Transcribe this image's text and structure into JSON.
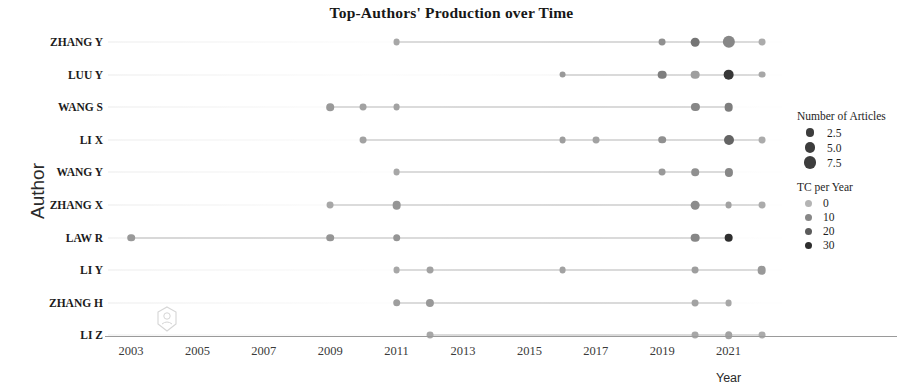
{
  "chart_data": {
    "type": "scatter",
    "title": "Top-Authors' Production over Time",
    "xlabel": "Year",
    "ylabel": "Author",
    "xlim": [
      2002,
      2022.6
    ],
    "xticks": [
      2003,
      2005,
      2007,
      2009,
      2011,
      2013,
      2015,
      2017,
      2019,
      2021
    ],
    "grid": false,
    "legend_position": "right",
    "categories": [
      "ZHANG Y",
      "LUU Y",
      "WANG S",
      "LI X",
      "WANG Y",
      "ZHANG X",
      "LAW R",
      "LI Y",
      "ZHANG H",
      "LI Z"
    ],
    "series": [
      {
        "name": "ZHANG Y",
        "span": [
          2011,
          2022
        ],
        "points": [
          {
            "year": 2011,
            "articles": 1,
            "tc_per_year": 3
          },
          {
            "year": 2019,
            "articles": 1,
            "tc_per_year": 8
          },
          {
            "year": 2020,
            "articles": 2.5,
            "tc_per_year": 14
          },
          {
            "year": 2021,
            "articles": 7.5,
            "tc_per_year": 10
          },
          {
            "year": 2022,
            "articles": 1,
            "tc_per_year": 2
          }
        ]
      },
      {
        "name": "LUU Y",
        "span": [
          2016,
          2022
        ],
        "points": [
          {
            "year": 2016,
            "articles": 1,
            "tc_per_year": 6
          },
          {
            "year": 2019,
            "articles": 2.5,
            "tc_per_year": 12
          },
          {
            "year": 2020,
            "articles": 2.5,
            "tc_per_year": 5
          },
          {
            "year": 2021,
            "articles": 5.0,
            "tc_per_year": 28
          },
          {
            "year": 2022,
            "articles": 1,
            "tc_per_year": 3
          }
        ]
      },
      {
        "name": "WANG S",
        "span": [
          2009,
          2021
        ],
        "points": [
          {
            "year": 2009,
            "articles": 1.5,
            "tc_per_year": 6
          },
          {
            "year": 2010,
            "articles": 1,
            "tc_per_year": 4
          },
          {
            "year": 2011,
            "articles": 1,
            "tc_per_year": 4
          },
          {
            "year": 2020,
            "articles": 2.0,
            "tc_per_year": 10
          },
          {
            "year": 2021,
            "articles": 2.5,
            "tc_per_year": 12
          }
        ]
      },
      {
        "name": "LI X",
        "span": [
          2010,
          2022
        ],
        "points": [
          {
            "year": 2010,
            "articles": 1,
            "tc_per_year": 4
          },
          {
            "year": 2016,
            "articles": 1,
            "tc_per_year": 5
          },
          {
            "year": 2017,
            "articles": 1,
            "tc_per_year": 4
          },
          {
            "year": 2019,
            "articles": 1.5,
            "tc_per_year": 8
          },
          {
            "year": 2021,
            "articles": 4.0,
            "tc_per_year": 18
          },
          {
            "year": 2022,
            "articles": 1,
            "tc_per_year": 2
          }
        ]
      },
      {
        "name": "WANG Y",
        "span": [
          2011,
          2021
        ],
        "points": [
          {
            "year": 2011,
            "articles": 1,
            "tc_per_year": 3
          },
          {
            "year": 2019,
            "articles": 1,
            "tc_per_year": 6
          },
          {
            "year": 2020,
            "articles": 1.5,
            "tc_per_year": 8
          },
          {
            "year": 2021,
            "articles": 2.0,
            "tc_per_year": 10
          }
        ]
      },
      {
        "name": "ZHANG X",
        "span": [
          2009,
          2022
        ],
        "points": [
          {
            "year": 2009,
            "articles": 1,
            "tc_per_year": 3
          },
          {
            "year": 2011,
            "articles": 2.5,
            "tc_per_year": 7
          },
          {
            "year": 2020,
            "articles": 2.5,
            "tc_per_year": 9
          },
          {
            "year": 2021,
            "articles": 1,
            "tc_per_year": 4
          },
          {
            "year": 2022,
            "articles": 1,
            "tc_per_year": 2
          }
        ]
      },
      {
        "name": "LAW R",
        "span": [
          2003,
          2021
        ],
        "points": [
          {
            "year": 2003,
            "articles": 1.5,
            "tc_per_year": 6
          },
          {
            "year": 2009,
            "articles": 1.5,
            "tc_per_year": 7
          },
          {
            "year": 2011,
            "articles": 1.5,
            "tc_per_year": 7
          },
          {
            "year": 2020,
            "articles": 2.5,
            "tc_per_year": 10
          },
          {
            "year": 2021,
            "articles": 2.5,
            "tc_per_year": 30
          }
        ]
      },
      {
        "name": "LI Y",
        "span": [
          2011,
          2022
        ],
        "points": [
          {
            "year": 2011,
            "articles": 1,
            "tc_per_year": 3
          },
          {
            "year": 2012,
            "articles": 1,
            "tc_per_year": 4
          },
          {
            "year": 2016,
            "articles": 1,
            "tc_per_year": 4
          },
          {
            "year": 2020,
            "articles": 1,
            "tc_per_year": 5
          },
          {
            "year": 2022,
            "articles": 2.5,
            "tc_per_year": 6
          }
        ]
      },
      {
        "name": "ZHANG H",
        "span": [
          2011,
          2021
        ],
        "points": [
          {
            "year": 2011,
            "articles": 1.5,
            "tc_per_year": 5
          },
          {
            "year": 2012,
            "articles": 2.0,
            "tc_per_year": 6
          },
          {
            "year": 2020,
            "articles": 1,
            "tc_per_year": 4
          },
          {
            "year": 2021,
            "articles": 1,
            "tc_per_year": 3
          }
        ]
      },
      {
        "name": "LI Z",
        "span": [
          2012,
          2022
        ],
        "points": [
          {
            "year": 2012,
            "articles": 1,
            "tc_per_year": 3
          },
          {
            "year": 2020,
            "articles": 1,
            "tc_per_year": 3
          },
          {
            "year": 2021,
            "articles": 1.5,
            "tc_per_year": 4
          },
          {
            "year": 2022,
            "articles": 1,
            "tc_per_year": 2
          }
        ]
      }
    ],
    "legend": {
      "size_legend": {
        "title": "Number of Articles",
        "entries": [
          "2.5",
          "5.0",
          "7.5"
        ],
        "values": [
          2.5,
          5.0,
          7.5
        ]
      },
      "color_legend": {
        "title": "TC per Year",
        "entries": [
          "0",
          "10",
          "20",
          "30"
        ],
        "values": [
          0,
          10,
          20,
          30
        ]
      }
    },
    "colors": {
      "line": "#b9b9b9",
      "dot_light": "#b0b0b0",
      "dot_mid": "#7e7e7e",
      "dot_dark": "#3c3c3c",
      "axis": "#9a9a9a",
      "text": "#1a1a1a"
    }
  }
}
